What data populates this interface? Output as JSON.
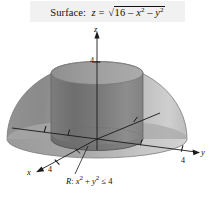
{
  "figure": {
    "title_prefix": "Surface:",
    "title_var": "z",
    "title_equals": "=",
    "radicand_const": "16",
    "minus_1": "–",
    "var_x": "x",
    "minus_2": "–",
    "var_y": "y",
    "exponent": "2",
    "full_title_plain": "Surface: z = √(16 – x² – y²)"
  },
  "axes": {
    "z_label": "z",
    "y_label": "y",
    "x_label": "x",
    "z_tick_label": "4",
    "y_tick_label": "4",
    "x_tick_label": "4"
  },
  "region": {
    "name": "R",
    "colon": ":",
    "expr_x": "x",
    "plus": "+",
    "expr_y": "y",
    "exponent": "2",
    "relation": "≤",
    "bound": "4",
    "full_plain": "R: x² + y² ≤ 4"
  },
  "colors": {
    "background": "#ffffff",
    "caption_bg": "#f1f1f1",
    "ink": "#111111",
    "dome_left": "#8e8e8e",
    "dome_right": "#bdbdbd",
    "dome_highlight": "#d6d6d6",
    "dome_base_left": "#9a9a9a",
    "dome_base_right": "#cfcfcf",
    "cylinder_body": "#737373",
    "cylinder_body_light": "#8a8a8a",
    "cylinder_top": "#9d9d9d",
    "cylinder_base_shadow": "#656565",
    "axis_line": "#1a1a1a"
  },
  "geometry": {
    "dome_center_x": 97,
    "dome_base_y": 139,
    "dome_radius_x": 90,
    "dome_radius_y": 76,
    "dome_base_ellipse_ry": 19,
    "cylinder_center_x": 97,
    "cylinder_radius_x": 46,
    "cylinder_radius_y": 11.5,
    "cylinder_top_y": 73,
    "cylinder_bottom_y": 139
  }
}
